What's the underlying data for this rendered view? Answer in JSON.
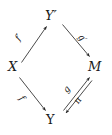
{
  "diagram": {
    "type": "commutative-diagram",
    "background_color": "#ffffff",
    "ink_color": "#1a1a1a",
    "nodes": [
      {
        "id": "yprime",
        "label": "Y′",
        "position": "top",
        "style": "italic"
      },
      {
        "id": "x",
        "label": "X",
        "position": "left",
        "style": "italic"
      },
      {
        "id": "m",
        "label": "M",
        "position": "right",
        "style": "italic"
      },
      {
        "id": "y",
        "label": "Y",
        "position": "bottom",
        "style": "upright"
      }
    ],
    "edges": [
      {
        "id": "fprime",
        "label": "f′",
        "from": "x",
        "to": "yprime",
        "direction": "up-right"
      },
      {
        "id": "gprime",
        "label": "g′",
        "from": "yprime",
        "to": "m",
        "direction": "down-right"
      },
      {
        "id": "f",
        "label": "f",
        "from": "x",
        "to": "y",
        "direction": "down-right"
      },
      {
        "id": "g",
        "label": "g",
        "from": "y",
        "to": "m",
        "direction": "up-right"
      },
      {
        "id": "pi",
        "label": "π",
        "from": "m",
        "to": "y",
        "direction": "down-left"
      }
    ]
  }
}
